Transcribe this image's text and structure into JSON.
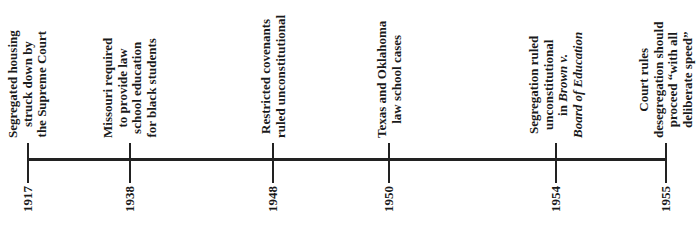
{
  "axis": {
    "start_year": "1917",
    "end_year": "1955",
    "color": "#222222"
  },
  "events": [
    {
      "year": "1917",
      "x": 28,
      "lines": [
        "Segregated housing",
        "struck down by",
        "the Supreme Court"
      ]
    },
    {
      "year": "1938",
      "x": 130,
      "lines": [
        "Missouri required",
        "to provide law",
        "school education",
        "for black students"
      ]
    },
    {
      "year": "1948",
      "x": 273,
      "lines": [
        "Restricted covenants",
        "ruled unconstitutional"
      ]
    },
    {
      "year": "1950",
      "x": 389,
      "lines": [
        "Texas and Oklahoma",
        "law school cases"
      ]
    },
    {
      "year": "1954",
      "x": 556,
      "lines": [
        "Segregation ruled",
        "unconstitutional",
        "in Brown v.",
        "Board of Education"
      ],
      "italic_parts": [
        "Brown v.",
        "Board of Education"
      ]
    },
    {
      "year": "1955",
      "x": 666,
      "lines": [
        "Court rules",
        "desegregation should",
        "proceed “with all",
        "deliberate speed”"
      ]
    }
  ]
}
